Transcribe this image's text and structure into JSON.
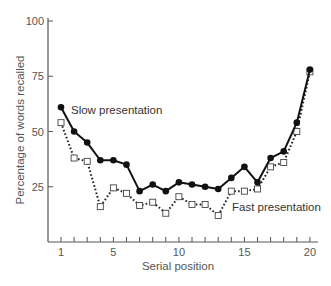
{
  "chart_data": {
    "type": "line",
    "title": "",
    "xlabel": "Serial position",
    "ylabel": "Percentage of words recalled",
    "xlim": [
      1,
      20
    ],
    "ylim": [
      0,
      100
    ],
    "x_ticks": [
      1,
      5,
      10,
      15,
      20
    ],
    "y_ticks": [
      25,
      50,
      75,
      100
    ],
    "grid": false,
    "legend": "inline labels",
    "x": [
      1,
      2,
      3,
      4,
      5,
      6,
      7,
      8,
      9,
      10,
      11,
      12,
      13,
      14,
      15,
      16,
      17,
      18,
      19,
      20
    ],
    "series": [
      {
        "name": "Slow presentation",
        "style": "solid line, filled circle markers",
        "color": "#111111",
        "values": [
          61,
          50,
          45,
          37,
          37,
          35,
          23,
          26,
          23,
          27,
          26,
          25,
          24,
          29,
          34,
          27,
          38,
          41,
          54,
          78
        ]
      },
      {
        "name": "Fast presentation",
        "style": "dotted line, open square markers",
        "color": "#111111",
        "values": [
          54,
          38,
          36.5,
          16,
          24.5,
          22,
          16.5,
          18,
          13,
          20.5,
          17,
          17,
          12,
          23,
          23,
          24,
          34,
          36,
          50,
          77
        ]
      }
    ],
    "annotations": [
      {
        "text": "Slow presentation",
        "near_series": "Slow presentation",
        "x": 1.8,
        "y": 60
      },
      {
        "text": "Fast presentation",
        "near_series": "Fast presentation",
        "x": 14,
        "y": 15
      }
    ]
  }
}
